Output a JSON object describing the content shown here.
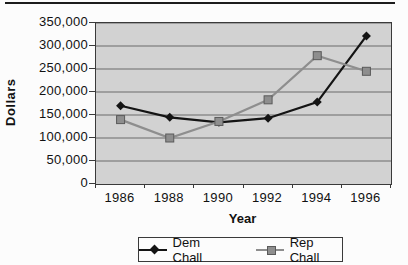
{
  "figure": {
    "top_rule_color": "#1c1c1c"
  },
  "chart_data": {
    "type": "line",
    "title": "",
    "categories": [
      "1986",
      "1988",
      "1990",
      "1992",
      "1994",
      "1996"
    ],
    "series": [
      {
        "name": "Dem Chall",
        "values": [
          170000,
          145000,
          134000,
          143000,
          178000,
          322000
        ],
        "color": "#141414",
        "marker": "diamond"
      },
      {
        "name": "Rep Chall",
        "values": [
          140000,
          100000,
          136000,
          183000,
          279000,
          245000
        ],
        "color": "#8e8e8e",
        "marker": "square",
        "marker_border": "#5a5a5a"
      }
    ],
    "xlabel": "Year",
    "ylabel": "Dollars",
    "ylim": [
      0,
      350000
    ],
    "ytick_step": 50000,
    "y_tick_labels": [
      "350,000",
      "300,000",
      "250,000",
      "200,000",
      "150,000",
      "100,000",
      "50,000",
      "0"
    ],
    "x_tick_labels": [
      "1986",
      "1988",
      "1990",
      "1992",
      "1994",
      "1996"
    ],
    "grid": true,
    "legend_position": "bottom",
    "plot_bg": "#d2d2d2",
    "grid_color": "#6a6a6a",
    "axis_color": "#3a3a3a"
  }
}
